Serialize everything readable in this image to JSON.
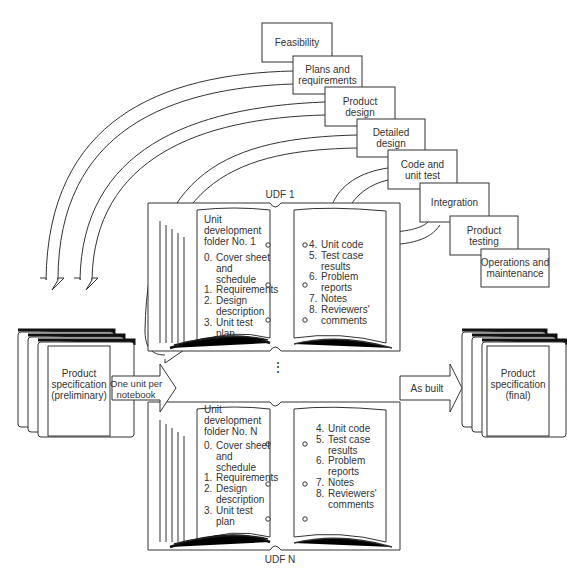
{
  "phases": [
    {
      "label": "Feasibility"
    },
    {
      "label": "Plans and\nrequirements"
    },
    {
      "label": "Product\ndesign"
    },
    {
      "label": "Detailed\ndesign"
    },
    {
      "label": "Code and\nunit test"
    },
    {
      "label": "Integration"
    },
    {
      "label": "Product\ntesting"
    },
    {
      "label": "Operations and\nmaintenance"
    }
  ],
  "udf1": {
    "caption": "UDF 1",
    "title": "Unit\ndevelopment\nfolder No. 1",
    "left_items": [
      {
        "num": "0.",
        "text": "Cover sheet\nand\nschedule"
      },
      {
        "num": "1.",
        "text": "Requirements"
      },
      {
        "num": "2.",
        "text": "Design\ndescription"
      },
      {
        "num": "3.",
        "text": "Unit test\nplan"
      }
    ],
    "right_items": [
      {
        "num": "4.",
        "text": "Unit code"
      },
      {
        "num": "5.",
        "text": "Test case\nresults"
      },
      {
        "num": "6.",
        "text": "Problem\nreports"
      },
      {
        "num": "7.",
        "text": "Notes"
      },
      {
        "num": "8.",
        "text": "Reviewers'\ncomments"
      }
    ]
  },
  "udfN": {
    "caption": "UDF N",
    "title": "Unit\ndevelopment\nfolder No. N",
    "left_items": [
      {
        "num": "0.",
        "text": "Cover sheet\nand\nschedule"
      },
      {
        "num": "1.",
        "text": "Requirements"
      },
      {
        "num": "2.",
        "text": "Design\ndescription"
      },
      {
        "num": "3.",
        "text": "Unit test\nplan"
      }
    ],
    "right_items": [
      {
        "num": "4.",
        "text": "Unit code"
      },
      {
        "num": "5.",
        "text": "Test case\nresults"
      },
      {
        "num": "6.",
        "text": "Problem\nreports"
      },
      {
        "num": "7.",
        "text": "Notes"
      },
      {
        "num": "8.",
        "text": "Reviewers'\ncomments"
      }
    ]
  },
  "ellipsis": "⋮",
  "spec_prelim": {
    "label": "Product\nspecification\n(preliminary)"
  },
  "spec_final": {
    "label": "Product\nspecification\n(final)"
  },
  "arrow_in": {
    "label": "One unit per\nnotebook"
  },
  "arrow_out": {
    "label": "As built"
  }
}
